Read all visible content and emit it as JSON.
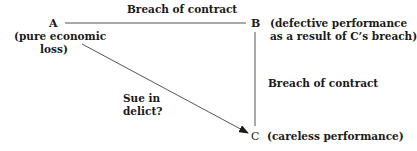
{
  "diagram": {
    "nodes": {
      "a": {
        "letter": "A",
        "desc_line1": "(pure economic",
        "desc_line2": "loss)"
      },
      "b": {
        "letter": "B",
        "desc_line1": "(defective performance",
        "desc_line2": "as a result of C’s breach)"
      },
      "c": {
        "letter": "C",
        "desc": "(careless performance)"
      }
    },
    "edges": {
      "a_b": {
        "label": "Breach of contract",
        "style": "line"
      },
      "b_c": {
        "label": "Breach of contract",
        "style": "line"
      },
      "a_c": {
        "label_line1": "Sue in",
        "label_line2": "delict?",
        "style": "arrow"
      }
    },
    "colors": {
      "line": "#555555",
      "text": "#1a1a1a"
    }
  }
}
